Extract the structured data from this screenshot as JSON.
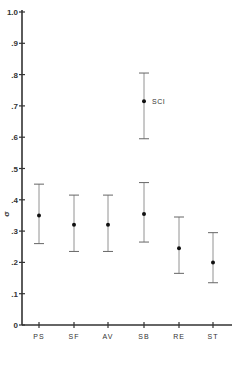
{
  "chart_data": {
    "type": "scatter",
    "subtype": "error-bar",
    "title": "",
    "xlabel": "",
    "ylabel": "σ",
    "ylim": [
      0,
      1.0
    ],
    "yticks": [
      0,
      0.1,
      0.2,
      0.3,
      0.4,
      0.5,
      0.6,
      0.7,
      0.8,
      0.9,
      1.0
    ],
    "ytick_labels": [
      "0",
      ".1",
      ".2",
      ".3",
      ".4",
      ".5",
      ".6",
      ".7",
      ".8",
      ".9",
      "1.0"
    ],
    "categories": [
      "PS",
      "SF",
      "AV",
      "SB",
      "RE",
      "ST"
    ],
    "grid": false,
    "legend": null,
    "series": [
      {
        "name": "main",
        "points": [
          {
            "category": "PS",
            "mean": 0.35,
            "upper": 0.45,
            "lower": 0.26
          },
          {
            "category": "SF",
            "mean": 0.32,
            "upper": 0.415,
            "lower": 0.235
          },
          {
            "category": "AV",
            "mean": 0.32,
            "upper": 0.415,
            "lower": 0.235
          },
          {
            "category": "SB",
            "mean": 0.355,
            "upper": 0.455,
            "lower": 0.265
          },
          {
            "category": "RE",
            "mean": 0.245,
            "upper": 0.345,
            "lower": 0.165
          },
          {
            "category": "ST",
            "mean": 0.2,
            "upper": 0.295,
            "lower": 0.135
          }
        ]
      },
      {
        "name": "SCI",
        "points": [
          {
            "category": "SB",
            "mean": 0.715,
            "upper": 0.805,
            "lower": 0.595
          }
        ]
      }
    ],
    "annotations": [
      {
        "text": "SCI",
        "category": "SB",
        "y": 0.715
      }
    ]
  }
}
